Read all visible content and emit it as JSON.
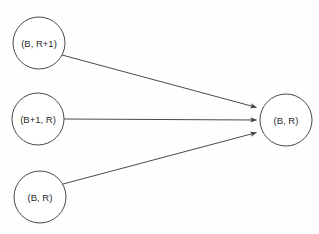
{
  "diagram": {
    "background_color": "#fefefe",
    "stroke_color": "#4a4a4a",
    "text_color": "#2b2b2b",
    "nodes": [
      {
        "id": "node-b-rplus1",
        "label": "(B, R+1)",
        "cx": 39,
        "cy": 43,
        "r": 26
      },
      {
        "id": "node-bplus1-r",
        "label": "(B+1, R)",
        "cx": 38,
        "cy": 119,
        "r": 26
      },
      {
        "id": "node-b-r-source",
        "label": "(B, R)",
        "cx": 40,
        "cy": 197,
        "r": 26
      },
      {
        "id": "node-b-r-target",
        "label": "(B, R)",
        "cx": 286,
        "cy": 120,
        "r": 26
      }
    ],
    "edges": [
      {
        "id": "edge-top",
        "from": "node-b-rplus1",
        "to": "node-b-r-target",
        "x1": 62,
        "y1": 55,
        "x2": 259,
        "y2": 108,
        "directed": true
      },
      {
        "id": "edge-middle",
        "from": "node-bplus1-r",
        "to": "node-b-r-target",
        "x1": 64,
        "y1": 119,
        "x2": 259,
        "y2": 120,
        "directed": true
      },
      {
        "id": "edge-bottom",
        "from": "node-b-r-source",
        "to": "node-b-r-target",
        "x1": 63,
        "y1": 184,
        "x2": 259,
        "y2": 132,
        "directed": true
      }
    ]
  }
}
